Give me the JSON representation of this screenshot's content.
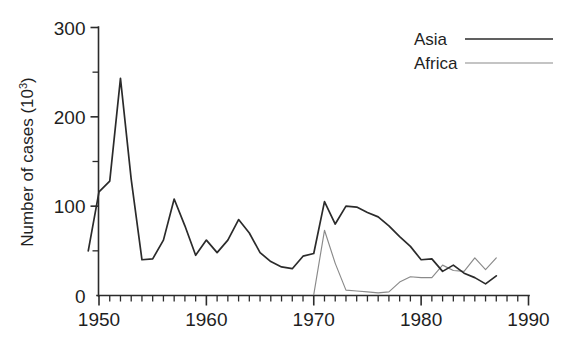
{
  "chart_data": {
    "type": "line",
    "title": "",
    "xlabel": "",
    "ylabel": "Number of cases (10³)",
    "ylabel_base": "Number of cases (10",
    "ylabel_sup": "3",
    "ylabel_tail": ")",
    "xlim": [
      1949,
      1990
    ],
    "ylim": [
      0,
      300
    ],
    "grid": false,
    "legend_position": "top-right",
    "x_ticks_major": [
      1950,
      1960,
      1970,
      1980,
      1990
    ],
    "x_tick_labels": [
      "1950",
      "1960",
      "1970",
      "1980",
      "1990"
    ],
    "x_minor_step": 1,
    "y_ticks_major": [
      0,
      100,
      200,
      300
    ],
    "y_tick_labels": [
      "0",
      "100",
      "200",
      "300"
    ],
    "y_ticks_minor": [
      50,
      150,
      250
    ],
    "colors": {
      "asia": "#2b2b2b",
      "africa": "#8a8a8a",
      "axis": "#2b2b2b",
      "background": "#ffffff"
    },
    "series": [
      {
        "name": "Asia",
        "color": "#2b2b2b",
        "x": [
          1949,
          1950,
          1951,
          1952,
          1953,
          1954,
          1955,
          1956,
          1957,
          1958,
          1959,
          1960,
          1961,
          1962,
          1963,
          1964,
          1965,
          1966,
          1967,
          1968,
          1969,
          1970,
          1971,
          1972,
          1973,
          1974,
          1975,
          1976,
          1977,
          1978,
          1979,
          1980,
          1981,
          1982,
          1983,
          1984,
          1985,
          1986,
          1987
        ],
        "values": [
          50,
          116,
          128,
          243,
          130,
          40,
          41,
          62,
          108,
          78,
          45,
          62,
          48,
          62,
          85,
          70,
          48,
          38,
          32,
          30,
          44,
          47,
          105,
          80,
          100,
          99,
          93,
          88,
          78,
          66,
          55,
          40,
          41,
          27,
          34,
          25,
          20,
          13,
          22
        ]
      },
      {
        "name": "Africa",
        "color": "#8a8a8a",
        "x": [
          1970,
          1971,
          1972,
          1973,
          1974,
          1975,
          1976,
          1977,
          1978,
          1979,
          1980,
          1981,
          1982,
          1983,
          1984,
          1985,
          1986,
          1987
        ],
        "values": [
          1,
          73,
          36,
          6,
          5,
          4,
          3,
          4,
          15,
          21,
          20,
          20,
          34,
          28,
          27,
          42,
          29,
          42
        ]
      }
    ],
    "legend": [
      {
        "label": "Asia",
        "color": "#2b2b2b",
        "style": "solid-thick"
      },
      {
        "label": "Africa",
        "color": "#8a8a8a",
        "style": "solid-thin"
      }
    ]
  }
}
